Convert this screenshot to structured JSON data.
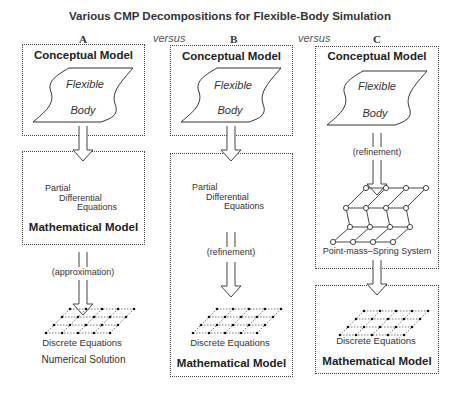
{
  "title": "Various CMP Decompositions for Flexible-Body Simulation",
  "columns": [
    {
      "id": "A",
      "heading": "A",
      "conceptual_title": "Conceptual Model",
      "shape_text": [
        "Flexible",
        "Body"
      ],
      "math_title": "Mathematical Model",
      "pde_lines": [
        "Partial",
        "Differential",
        "Equations"
      ],
      "transition": "(approximation)",
      "grid_label": "Discrete Equations",
      "bottom_label": "Numerical Solution"
    },
    {
      "id": "B",
      "heading": "B",
      "conceptual_title": "Conceptual Model",
      "shape_text": [
        "Flexible",
        "Body"
      ],
      "pde_lines": [
        "Partial",
        "Differential",
        "Equations"
      ],
      "transition": "(refinement)",
      "grid_label": "Discrete Equations",
      "math_title": "Mathematical Model"
    },
    {
      "id": "C",
      "heading": "C",
      "conceptual_title": "Conceptual Model",
      "shape_text": [
        "Flexible",
        "Body"
      ],
      "transition": "(refinement)",
      "spring_label": "Point-mass–Spring System",
      "grid_label": "Discrete Equations",
      "math_title": "Mathematical Model"
    }
  ],
  "versus": [
    "versus",
    "versus"
  ]
}
